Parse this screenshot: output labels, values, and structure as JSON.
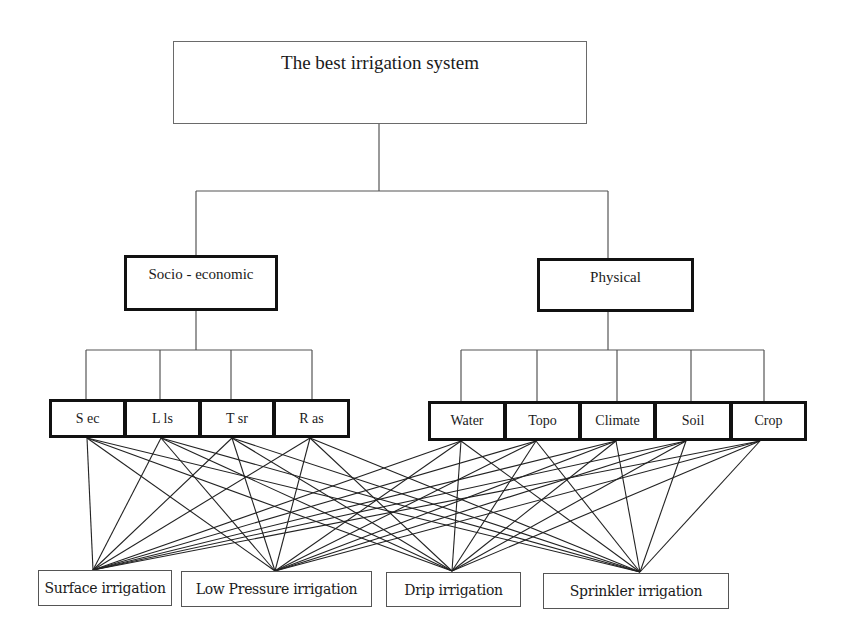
{
  "diagram": {
    "type": "AHP hierarchy",
    "goal": {
      "label": "The best irrigation system",
      "box": {
        "x": 173,
        "y": 41,
        "w": 414,
        "h": 83
      }
    },
    "groups": [
      {
        "id": "socio",
        "label": "Socio - economic",
        "box": {
          "x": 124,
          "y": 255,
          "w": 154,
          "h": 56
        },
        "anchor_x": 196
      },
      {
        "id": "physical",
        "label": "Physical",
        "box": {
          "x": 537,
          "y": 258,
          "w": 157,
          "h": 54
        },
        "anchor_x": 608
      }
    ],
    "criteria": [
      {
        "id": "sec",
        "label": "S ec",
        "group": "socio",
        "box": {
          "x": 49,
          "y": 399,
          "w": 77,
          "h": 39
        },
        "top_x": 86,
        "bottom_x": 87
      },
      {
        "id": "lls",
        "label": "L ls",
        "group": "socio",
        "box": {
          "x": 124,
          "y": 399,
          "w": 77,
          "h": 39
        },
        "top_x": 160,
        "bottom_x": 161
      },
      {
        "id": "tsr",
        "label": "T sr",
        "group": "socio",
        "box": {
          "x": 199,
          "y": 399,
          "w": 76,
          "h": 39
        },
        "top_x": 231,
        "bottom_x": 232
      },
      {
        "id": "ras",
        "label": "R as",
        "group": "socio",
        "box": {
          "x": 273,
          "y": 399,
          "w": 77,
          "h": 39
        },
        "top_x": 312,
        "bottom_x": 310
      },
      {
        "id": "water",
        "label": "Water",
        "group": "physical",
        "box": {
          "x": 428,
          "y": 401,
          "w": 78,
          "h": 40
        },
        "top_x": 461,
        "bottom_x": 461
      },
      {
        "id": "topo",
        "label": "Topo",
        "group": "physical",
        "box": {
          "x": 504,
          "y": 401,
          "w": 77,
          "h": 40
        },
        "top_x": 537,
        "bottom_x": 536
      },
      {
        "id": "climate",
        "label": "Climate",
        "group": "physical",
        "box": {
          "x": 579,
          "y": 401,
          "w": 77,
          "h": 40
        },
        "top_x": 617,
        "bottom_x": 616
      },
      {
        "id": "soil",
        "label": "Soil",
        "group": "physical",
        "box": {
          "x": 654,
          "y": 401,
          "w": 78,
          "h": 40
        },
        "top_x": 691,
        "bottom_x": 686
      },
      {
        "id": "crop",
        "label": "Crop",
        "group": "physical",
        "box": {
          "x": 730,
          "y": 401,
          "w": 77,
          "h": 40
        },
        "top_x": 764,
        "bottom_x": 760
      }
    ],
    "alternatives": [
      {
        "id": "surface",
        "label": "Surface irrigation",
        "box": {
          "x": 38,
          "y": 570,
          "w": 134,
          "h": 36
        },
        "anchor": {
          "x": 93,
          "y": 570
        }
      },
      {
        "id": "low_pressure",
        "label": "Low Pressure irrigation",
        "box": {
          "x": 181,
          "y": 571,
          "w": 191,
          "h": 36
        },
        "anchor": {
          "x": 275,
          "y": 571
        }
      },
      {
        "id": "drip",
        "label": "Drip irrigation",
        "box": {
          "x": 386,
          "y": 572,
          "w": 135,
          "h": 35
        },
        "anchor": {
          "x": 452,
          "y": 571
        }
      },
      {
        "id": "sprinkler",
        "label": "Sprinkler irrigation",
        "box": {
          "x": 543,
          "y": 573,
          "w": 186,
          "h": 36
        },
        "anchor": {
          "x": 640,
          "y": 572
        }
      }
    ],
    "connectors": {
      "goal_trunk": {
        "x": 379,
        "y1": 124,
        "y2": 191
      },
      "goal_bar": {
        "y": 191,
        "x1": 196,
        "x2": 608
      },
      "socio_bar_y": 350,
      "physical_bar_y": 350,
      "line_color": "#222222",
      "tree_line_color": "#555555"
    },
    "links_note": "Every criterion is connected to every alternative"
  }
}
